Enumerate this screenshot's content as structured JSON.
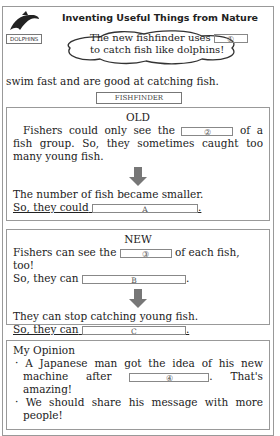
{
  "poster": {
    "title": "Inventing Useful Things from Nature",
    "dolphin_label": "DOLPHINS",
    "cloud_line1": "The new fishfinder uses",
    "cloud_blank": "①",
    "cloud_line2": "to catch fish like dolphins!",
    "intro_line": "swim fast and are good at catching fish.",
    "fishfinder_label": "FISHFINDER"
  },
  "old": {
    "heading": "OLD",
    "line1_pre": "Fishers could only see the",
    "blank2": "②",
    "line1_post": "of a fish",
    "line2": "group. So, they sometimes caught too many young fish.",
    "result1": "The number of fish became smaller.",
    "result2_pre": "So, they could",
    "blankA": "A"
  },
  "new": {
    "heading": "NEW",
    "line1_pre": "Fishers can see the",
    "blank3": "③",
    "line1_post": "of each fish, too!",
    "line2_pre": "So, they can",
    "blankB": "B",
    "result1": "They can stop catching young fish.",
    "result2_pre": "So, they can",
    "blankC": "C"
  },
  "opinion": {
    "heading": "My Opinion",
    "bullet1_pre": "A Japanese man got the idea of his new machine after",
    "blank4": "④",
    "bullet1_post": ". That's amazing!",
    "bullet2": "We should share his message with more people!"
  }
}
